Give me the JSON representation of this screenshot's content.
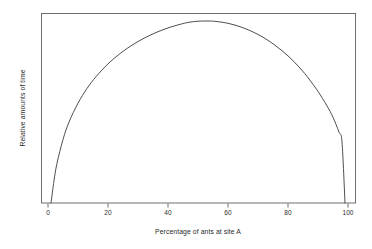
{
  "chart_data": {
    "type": "line",
    "title": "",
    "subtitle": "",
    "xlabel": "Percentage of ants at site A",
    "ylabel": "Relative amounts of time",
    "xlim": [
      0,
      100
    ],
    "ylim": [
      0,
      1
    ],
    "xticks": [
      "0",
      "20",
      "40",
      "60",
      "80",
      "100"
    ],
    "xtick_values": [
      0,
      20,
      40,
      60,
      80,
      100
    ],
    "yticks": [],
    "grid": false,
    "legend": null,
    "box": true,
    "annotations": [],
    "series": [
      {
        "name": "Relative amounts of time",
        "color": "#3a3a3a",
        "linewidth": 0.9,
        "x": [
          1,
          2,
          3,
          5,
          7,
          10,
          13,
          16,
          20,
          24,
          28,
          32,
          36,
          40,
          44,
          47,
          50,
          53,
          56,
          60,
          64,
          68,
          72,
          76,
          80,
          84,
          87,
          90,
          93,
          95,
          97,
          98,
          99
        ],
        "y": [
          0.0,
          0.106,
          0.189,
          0.302,
          0.385,
          0.475,
          0.545,
          0.601,
          0.662,
          0.711,
          0.751,
          0.784,
          0.811,
          0.833,
          0.85,
          0.86,
          0.865,
          0.866,
          0.864,
          0.855,
          0.839,
          0.816,
          0.786,
          0.747,
          0.7,
          0.642,
          0.59,
          0.531,
          0.462,
          0.408,
          0.337,
          0.29,
          0.0
        ]
      }
    ]
  },
  "axes": {
    "x_tick_labels": [
      "0",
      "20",
      "40",
      "60",
      "80",
      "100"
    ]
  }
}
